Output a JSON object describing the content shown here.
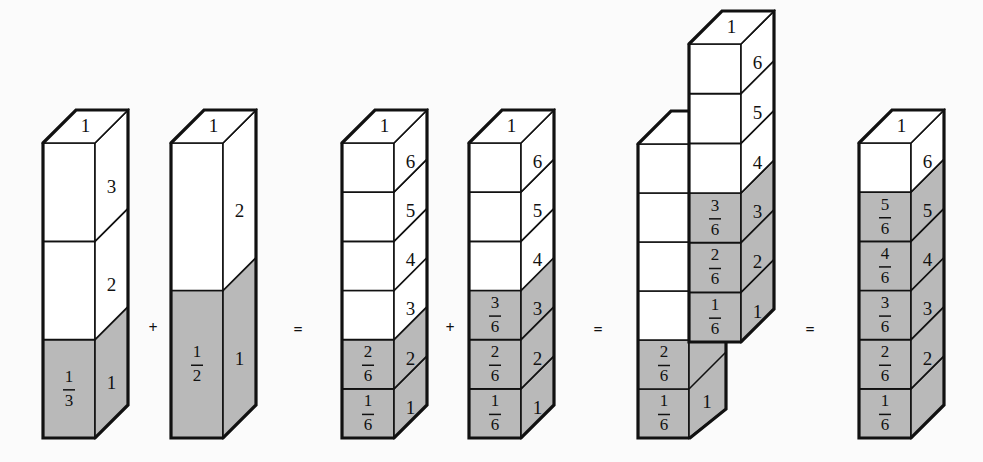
{
  "colors": {
    "background": "#fbfbfb",
    "shaded": "#b9b9b9",
    "unshaded": "#ffffff",
    "stroke": "#111111"
  },
  "geometry": {
    "base_y": 438,
    "depth_dx": 33,
    "depth_dy": -33,
    "front_width": 52
  },
  "operators": [
    {
      "symbol": "+",
      "x": 153,
      "y": 328
    },
    {
      "symbol": "=",
      "x": 298,
      "y": 330
    },
    {
      "symbol": "+",
      "x": 450,
      "y": 328
    },
    {
      "symbol": "=",
      "x": 598,
      "y": 330
    },
    {
      "symbol": "=",
      "x": 810,
      "y": 330
    }
  ],
  "columns": [
    {
      "name": "one-third-bar",
      "x": 43,
      "top_y": 143,
      "units": 3,
      "shaded": 1,
      "top_label": "1",
      "side_labels": [
        "1",
        "2",
        "3"
      ],
      "front_fractions": [
        {
          "num": "1",
          "den": "3"
        }
      ]
    },
    {
      "name": "one-half-bar",
      "x": 171,
      "top_y": 143,
      "units": 2,
      "shaded": 1,
      "top_label": "1",
      "side_labels": [
        "1",
        "2"
      ],
      "front_fractions": [
        {
          "num": "1",
          "den": "2"
        }
      ]
    },
    {
      "name": "two-sixths-bar",
      "x": 342,
      "top_y": 143,
      "units": 6,
      "shaded": 2,
      "top_label": "1",
      "side_labels": [
        "1",
        "2",
        "3",
        "4",
        "5",
        "6"
      ],
      "front_fractions": [
        {
          "num": "1",
          "den": "6"
        },
        {
          "num": "2",
          "den": "6"
        }
      ]
    },
    {
      "name": "three-sixths-bar",
      "x": 469,
      "top_y": 143,
      "units": 6,
      "shaded": 3,
      "top_label": "1",
      "side_labels": [
        "1",
        "2",
        "3",
        "4",
        "5",
        "6"
      ],
      "front_fractions": [
        {
          "num": "1",
          "den": "6"
        },
        {
          "num": "2",
          "den": "6"
        },
        {
          "num": "3",
          "den": "6"
        }
      ]
    },
    {
      "name": "five-sixths-result-bar",
      "x": 859,
      "top_y": 143,
      "units": 6,
      "shaded": 5,
      "top_label": "1",
      "side_labels": [
        "",
        "2",
        "3",
        "4",
        "5",
        "6"
      ],
      "front_fractions": [
        {
          "num": "1",
          "den": "6"
        },
        {
          "num": "2",
          "den": "6"
        },
        {
          "num": "3",
          "den": "6"
        },
        {
          "num": "4",
          "den": "6"
        },
        {
          "num": "5",
          "den": "6"
        }
      ]
    }
  ],
  "composite": {
    "name": "combined-bars",
    "left": {
      "x": 638,
      "top_y": 144,
      "units": 6,
      "shaded": 2,
      "front_fractions": [
        {
          "num": "1",
          "den": "6"
        },
        {
          "num": "2",
          "den": "6"
        }
      ],
      "side_label": "1"
    },
    "right": {
      "x": 689,
      "top_y": 44,
      "bottom_y": 342,
      "units": 6,
      "shaded": 3,
      "top_label": "1",
      "side_labels": [
        "1",
        "2",
        "3",
        "4",
        "5",
        "6"
      ],
      "front_fractions": [
        {
          "num": "1",
          "den": "6"
        },
        {
          "num": "2",
          "den": "6"
        },
        {
          "num": "3",
          "den": "6"
        }
      ]
    }
  }
}
